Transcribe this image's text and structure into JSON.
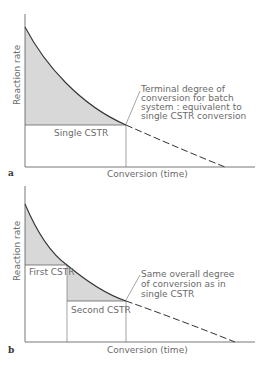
{
  "panels": [
    {
      "id": "a",
      "letter": "a",
      "ylabel": "Reaction rate",
      "xlabel": "Conversion (time)",
      "region_labels": [
        "Single CSTR"
      ],
      "annotation": [
        "Terminal degree of",
        "conversion for batch",
        "system : equivalent to",
        "single CSTR conversion"
      ]
    },
    {
      "id": "b",
      "letter": "b",
      "ylabel": "Reaction rate",
      "xlabel": "Conversion (time)",
      "region_labels": [
        "First CSTR",
        "Second CSTR"
      ],
      "annotation": [
        "Same overall degree",
        "of conversion as in",
        "single CSTR"
      ]
    }
  ],
  "colors": {
    "shade": "#d6d6d6",
    "line": "#3a3a3a",
    "thin": "#6a6a6a"
  }
}
